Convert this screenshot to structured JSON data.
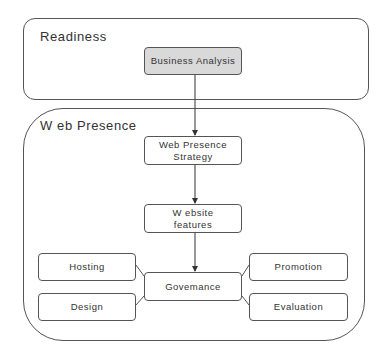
{
  "diagram": {
    "type": "flowchart",
    "colors": {
      "stroke": "#555555",
      "text": "#333333",
      "shaded_fill": "#d9d9d9",
      "background": "#ffffff"
    },
    "containers": [
      {
        "id": "readiness",
        "label": "Readiness"
      },
      {
        "id": "web-presence",
        "label": "W eb Presence"
      }
    ],
    "nodes": [
      {
        "id": "business-analysis",
        "label": "Business Analysis",
        "container": "readiness",
        "shaded": true
      },
      {
        "id": "web-presence-strategy",
        "label_line1": "Web Presence",
        "label_line2": "Strategy",
        "container": "web-presence"
      },
      {
        "id": "website-features",
        "label_line1": "W ebsite",
        "label_line2": "features",
        "container": "web-presence"
      },
      {
        "id": "governance",
        "label": "Govemance",
        "container": "web-presence"
      },
      {
        "id": "hosting",
        "label": "Hosting",
        "container": "web-presence"
      },
      {
        "id": "design",
        "label": "Design",
        "container": "web-presence"
      },
      {
        "id": "promotion",
        "label": "Promotion",
        "container": "web-presence"
      },
      {
        "id": "evaluation",
        "label": "Evaluation",
        "container": "web-presence"
      }
    ],
    "edges": [
      {
        "from": "business-analysis",
        "to": "web-presence-strategy",
        "arrow": true
      },
      {
        "from": "web-presence-strategy",
        "to": "website-features",
        "arrow": true
      },
      {
        "from": "website-features",
        "to": "governance",
        "arrow": true
      },
      {
        "from": "hosting",
        "to": "governance",
        "arrow": false
      },
      {
        "from": "design",
        "to": "governance",
        "arrow": false
      },
      {
        "from": "promotion",
        "to": "governance",
        "arrow": false
      },
      {
        "from": "evaluation",
        "to": "governance",
        "arrow": false
      }
    ]
  }
}
